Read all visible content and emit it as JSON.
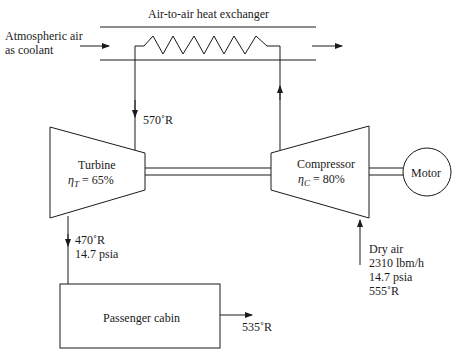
{
  "title": "Air-to-air heat exchanger",
  "coolant": {
    "line1": "Atmospheric air",
    "line2": "as coolant"
  },
  "turbine": {
    "label": "Turbine",
    "eff_symbol": "η",
    "eff_sub": "T",
    "eff_value": "= 65%"
  },
  "compressor": {
    "label": "Compressor",
    "eff_symbol": "η",
    "eff_sub": "C",
    "eff_value": "= 80%"
  },
  "motor": {
    "label": "Motor"
  },
  "cabin": {
    "label": "Passenger cabin"
  },
  "states": {
    "turbine_inlet": "570˚R",
    "turbine_outlet_temp": "470˚R",
    "turbine_outlet_pressure": "14.7 psia",
    "cabin_exit": "535˚R",
    "inlet": {
      "line1": "Dry air",
      "line2": "2310 lbm/h",
      "line3": "14.7 psia",
      "line4": "555˚R"
    }
  },
  "colors": {
    "line": "#1a1a1a",
    "background": "#ffffff"
  }
}
